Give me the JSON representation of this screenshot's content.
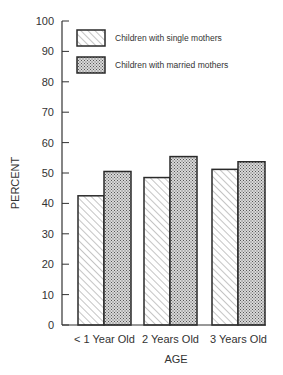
{
  "chart_data": {
    "type": "bar",
    "title": "",
    "xlabel": "AGE",
    "ylabel": "PERCENT",
    "ylim": [
      0,
      100
    ],
    "yticks": [
      0,
      10,
      20,
      30,
      40,
      50,
      60,
      70,
      80,
      90,
      100
    ],
    "grid": false,
    "legend_position": "top-left inside",
    "categories": [
      "< 1 Year Old",
      "2 Years Old",
      "3 Years Old"
    ],
    "series": [
      {
        "name": "Children with single mothers",
        "pattern": "diagonal-hatch",
        "values": [
          42.5,
          48.5,
          51.2
        ]
      },
      {
        "name": "Children with married mothers",
        "pattern": "dotted",
        "values": [
          50.5,
          55.4,
          53.7
        ]
      }
    ]
  },
  "colors": {
    "axis": "#333333",
    "bar_outline": "#2a2a2a",
    "hatch": "#8a8a8a",
    "dots": "#555555",
    "background": "#ffffff"
  }
}
